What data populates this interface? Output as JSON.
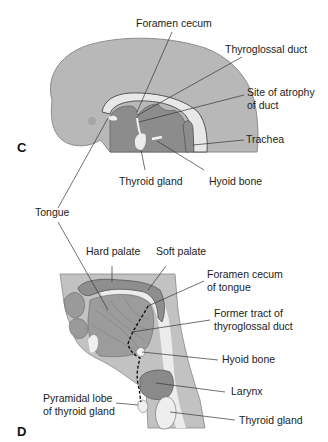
{
  "panels": {
    "C": {
      "letter": "C",
      "labels": {
        "foramen_cecum": "Foramen cecum",
        "thyroglossal_duct": "Thyroglossal duct",
        "site_of_atrophy_1": "Site of atrophy",
        "site_of_atrophy_2": "of duct",
        "trachea": "Trachea",
        "thyroid_gland": "Thyroid gland",
        "hyoid_bone": "Hyoid bone",
        "tongue": "Tongue"
      }
    },
    "D": {
      "letter": "D",
      "labels": {
        "hard_palate": "Hard palate",
        "soft_palate": "Soft palate",
        "foramen_cecum_1": "Foramen cecum",
        "foramen_cecum_2": "of tongue",
        "former_tract_1": "Former tract of",
        "former_tract_2": "thyroglossal duct",
        "hyoid_bone": "Hyoid bone",
        "larynx": "Larynx",
        "pyramidal_lobe_1": "Pyramidal lobe",
        "pyramidal_lobe_2": "of thyroid gland",
        "thyroid_gland": "Thyroid gland"
      }
    }
  },
  "colors": {
    "head_light": "#b4b4b4",
    "tissue_dark": "#8a8a8a",
    "cavity_light": "#e6e6e6",
    "outline": "#555555",
    "leader": "#333333"
  }
}
